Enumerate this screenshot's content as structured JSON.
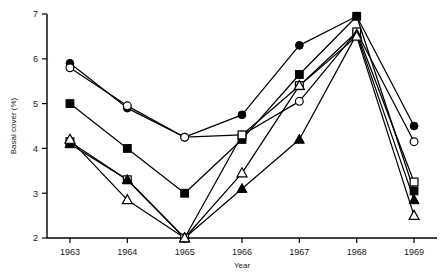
{
  "figure": {
    "cut_off_caption": "",
    "axis_color": "#000000"
  },
  "chart_data": {
    "type": "line",
    "title": "",
    "xlabel": "Year",
    "ylabel": "Basal cover (%)",
    "categories": [
      "1963",
      "1964",
      "1965",
      "1966",
      "1967",
      "1968",
      "1969"
    ],
    "x": [
      1963,
      1964,
      1965,
      1966,
      1967,
      1968,
      1969
    ],
    "xlim": [
      1962.6,
      1969.4
    ],
    "ylim": [
      2,
      7
    ],
    "yticks": [
      2,
      3,
      4,
      5,
      6,
      7
    ],
    "ytick_labels": [
      "2",
      "3",
      "4",
      "5",
      "6",
      "7"
    ],
    "grid": false,
    "legend": "none",
    "series": [
      {
        "name": "filled-circle",
        "marker": "filled-circle",
        "values": [
          5.9,
          4.9,
          4.25,
          4.75,
          6.3,
          6.95,
          4.5
        ]
      },
      {
        "name": "open-circle",
        "marker": "open-circle",
        "values": [
          5.8,
          4.95,
          4.25,
          4.3,
          5.05,
          6.6,
          4.15
        ]
      },
      {
        "name": "filled-square",
        "marker": "filled-square",
        "values": [
          5.0,
          4.0,
          3.0,
          4.2,
          5.65,
          6.95,
          3.05
        ]
      },
      {
        "name": "open-square",
        "marker": "open-square",
        "values": [
          4.15,
          3.3,
          2.0,
          4.3,
          5.4,
          6.6,
          3.25
        ]
      },
      {
        "name": "filled-triangle",
        "marker": "filled-triangle",
        "values": [
          4.1,
          3.3,
          2.0,
          3.1,
          4.2,
          6.55,
          2.85
        ]
      },
      {
        "name": "open-triangle",
        "marker": "open-triangle",
        "values": [
          4.2,
          2.85,
          2.0,
          3.45,
          5.4,
          6.5,
          2.5
        ]
      }
    ]
  }
}
